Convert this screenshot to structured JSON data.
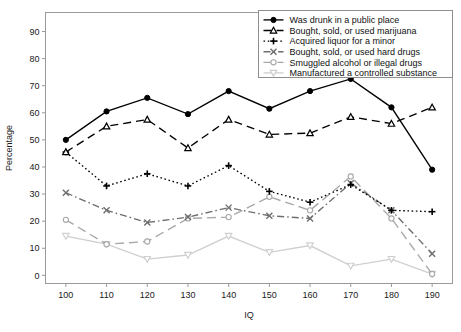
{
  "chart_data": {
    "type": "line",
    "title": "",
    "xlabel": "IQ",
    "ylabel": "Percentage",
    "categories": [
      100,
      110,
      120,
      130,
      140,
      150,
      160,
      170,
      180,
      190
    ],
    "x": [
      100,
      110,
      120,
      130,
      140,
      150,
      160,
      170,
      180,
      190
    ],
    "xlim": [
      95,
      195
    ],
    "ylim": [
      -3,
      97
    ],
    "xticks": [
      "100",
      "110",
      "120",
      "130",
      "140",
      "150",
      "160",
      "170",
      "180",
      "190"
    ],
    "yticks": [
      "0",
      "10",
      "20",
      "30",
      "40",
      "50",
      "60",
      "70",
      "80",
      "90"
    ],
    "grid": false,
    "legend_position": "top-right",
    "series": [
      {
        "name": "Was drunk in a public place",
        "values": [
          50,
          60.5,
          65.5,
          59.5,
          68,
          61.5,
          68,
          72.5,
          62,
          39
        ],
        "color": "#000000",
        "marker": "circle-filled",
        "dash": "none"
      },
      {
        "name": "Bought, sold, or used marijuana",
        "values": [
          45.5,
          55,
          57.5,
          47,
          57.5,
          52,
          52.5,
          58.5,
          56,
          62
        ],
        "color": "#000000",
        "marker": "triangle-up",
        "dash": "8,5"
      },
      {
        "name": "Acquired liquor for a minor",
        "values": [
          45.5,
          33,
          37.5,
          33,
          40.5,
          31,
          27,
          33.5,
          24,
          23.5
        ],
        "color": "#000000",
        "marker": "plus",
        "dash": "1.6,2.6"
      },
      {
        "name": "Bought, sold, or used hard drugs",
        "values": [
          30.5,
          24,
          19.5,
          21.5,
          25,
          22,
          21,
          34,
          24,
          8
        ],
        "color": "#6e6e6e",
        "marker": "cross",
        "dash": "7,3,1.6,3"
      },
      {
        "name": "Smuggled alcohol or illegal drugs",
        "values": [
          20.5,
          11.5,
          12.5,
          21,
          21.5,
          29,
          24,
          36.5,
          21,
          0.5
        ],
        "color": "#a8a8a8",
        "marker": "circle-open",
        "dash": "9,5"
      },
      {
        "name": "Manufactured a controlled substance",
        "values": [
          14.5,
          11.5,
          6,
          7.5,
          14.5,
          8.5,
          11,
          3.5,
          6,
          0.5
        ],
        "color": "#cfcfcf",
        "marker": "triangle-down",
        "dash": "none"
      }
    ]
  }
}
